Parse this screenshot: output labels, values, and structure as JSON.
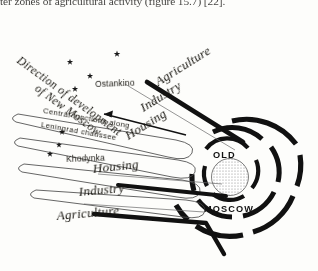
{
  "page": {
    "body_text": "ter zones of agricultural activity (figure 15.7) [22].",
    "background_color": "#fdfdfb",
    "ink_color": "#17150f"
  },
  "figure": {
    "name": "moscow-development-schema",
    "direction_label": {
      "line1": "Direction of development",
      "line2": "of New Moscow"
    },
    "places": [
      {
        "name": "Ostankino",
        "marker": "star-marker"
      },
      {
        "name": "Khodynka",
        "marker": "star-marker"
      }
    ],
    "corridor_labels": [
      "Central  functions  along",
      "Leningrad  chaussee"
    ],
    "zones_upper": [
      "Agriculture",
      "Industry",
      "Housing"
    ],
    "zones_lower": [
      "Housing",
      "Industry",
      "Agriculture"
    ],
    "core": {
      "line1": "OLD",
      "line2": "MOSCOW"
    },
    "unlabeled_markers": 5
  }
}
